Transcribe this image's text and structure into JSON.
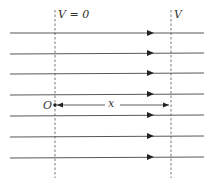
{
  "diagram": {
    "type": "uniform electric field lines with equipotential surfaces",
    "labels": {
      "v_zero": "V = 0",
      "v": "V",
      "origin": "O",
      "distance": "x"
    },
    "field_line_count": 7,
    "field_direction": "right",
    "colors": {
      "line": "#333333",
      "background": "#ffffff"
    }
  }
}
